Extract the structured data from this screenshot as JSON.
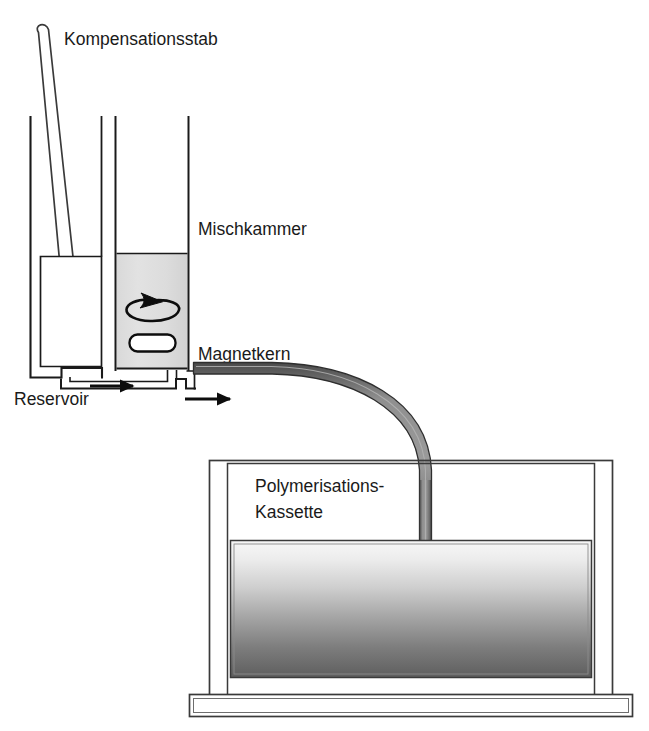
{
  "figure": {
    "kind": "technical-cross-section-diagram",
    "language": "de",
    "background_color": "#ffffff",
    "line_color": "#1a1a1a"
  },
  "labels": {
    "compensation_rod": "Kompensationsstab",
    "mixing_chamber": "Mischkammer",
    "magnet_core": "Magnetkern",
    "reservoir": "Reservoir",
    "cassette_line1": "Polymerisations-",
    "cassette_line2": "Kassette"
  },
  "parts": {
    "compensation_rod": {
      "name": "Kompensationsstab",
      "shape": "slender-rounded-rod",
      "orientation": "tilted",
      "fill": "#ffffff",
      "stroke": "#333333"
    },
    "reservoir": {
      "name": "Reservoir",
      "shape": "open-rectangular-vessel",
      "fill": "#ffffff",
      "stroke": "#1a1a1a"
    },
    "mixing_chamber": {
      "name": "Mischkammer",
      "shape": "vertical-column-vessel",
      "liquid_fill_top": "#dedede",
      "liquid_fill_bottom": "#d4d4d4",
      "stroke": "#1a1a1a"
    },
    "stir_arrow": {
      "name": "rotation-arrow",
      "shape": "ellipse-with-arrowhead",
      "stroke": "#0d0d0d"
    },
    "magnet_core": {
      "name": "Magnetkern",
      "shape": "rounded-rectangle",
      "fill": "#ffffff",
      "stroke": "#0d0d0d"
    },
    "flow_arrows": {
      "count": 2,
      "direction": "rightward",
      "color": "#0d0d0d"
    },
    "tube": {
      "name": "delivery-tube",
      "shape": "quarter-bend-band",
      "fill": "#8a8a8a",
      "edge": "#3a3a3a"
    },
    "cassette": {
      "name": "Polymerisations-Kassette",
      "shape": "double-walled-box",
      "fill": "#ffffff",
      "stroke": "#3a3a3a",
      "contents_gradient_top": "#f2f2f2",
      "contents_gradient_bottom": "#5a5a5a"
    },
    "stand": {
      "name": "base-plate",
      "shape": "flat-slab",
      "fill": "#ffffff",
      "stroke": "#3a3a3a"
    }
  }
}
